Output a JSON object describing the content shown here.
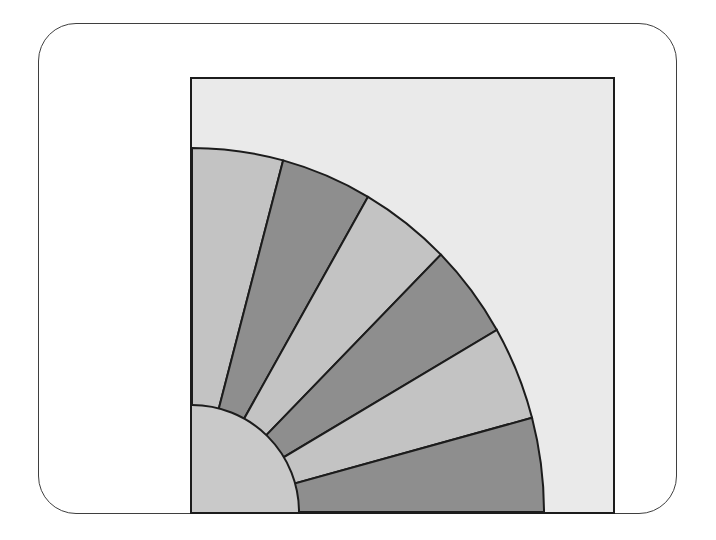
{
  "canvas": {
    "background_color": "#ffffff"
  },
  "card": {
    "background_color": "#ffffff",
    "border_color": "#3f3f3f",
    "corner_radius_px": 38
  },
  "panel": {
    "background_color": "#eaeaea",
    "border_color": "#1c1c1c",
    "border_width_px": 2
  },
  "fan": {
    "description": "Quarter-circle fan of alternating gray sectors centered at the panel bottom-left corner, with a plain light hub quarter-disc",
    "center": "panel-bottom-left",
    "outer_radius_x_px": 352,
    "outer_radius_y_px": 364,
    "hub_radius_px": 107,
    "start_angle_deg": 90,
    "end_angle_deg": 0,
    "sector_sweep_deg": 15,
    "sector_count": 6,
    "line_color": "#1c1c1c",
    "line_width_px": 2,
    "colors": {
      "light": "#c3c3c3",
      "dark": "#8e8e8e",
      "hub": "#c9c9c9"
    },
    "sectors": [
      {
        "index": 1,
        "from_deg": 90,
        "to_deg": 75,
        "shade": "light"
      },
      {
        "index": 2,
        "from_deg": 75,
        "to_deg": 60,
        "shade": "dark"
      },
      {
        "index": 3,
        "from_deg": 60,
        "to_deg": 45,
        "shade": "light"
      },
      {
        "index": 4,
        "from_deg": 45,
        "to_deg": 30,
        "shade": "dark"
      },
      {
        "index": 5,
        "from_deg": 30,
        "to_deg": 15,
        "shade": "light"
      },
      {
        "index": 6,
        "from_deg": 15,
        "to_deg": 0,
        "shade": "dark"
      }
    ]
  }
}
